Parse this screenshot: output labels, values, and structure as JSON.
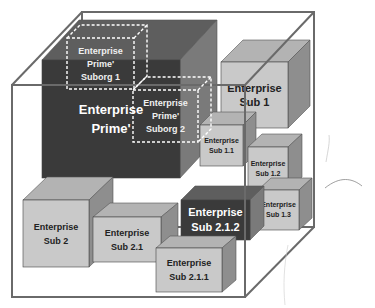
{
  "diagram": {
    "type": "nested-enterprise-cubes",
    "container": {
      "name": "enterprise-container-box"
    },
    "cubes": [
      {
        "id": "prime",
        "lines": [
          "Enterprise",
          "Prime'"
        ],
        "tone": "dark"
      },
      {
        "id": "sub1",
        "lines": [
          "Enterprise",
          "Sub 1"
        ],
        "tone": "light"
      },
      {
        "id": "sub1-1",
        "lines": [
          "Enterprise",
          "Sub 1.1"
        ],
        "tone": "light"
      },
      {
        "id": "sub1-2",
        "lines": [
          "Enterprise",
          "Sub 1.2"
        ],
        "tone": "light"
      },
      {
        "id": "sub1-3",
        "lines": [
          "Enterprise",
          "Sub 1.3"
        ],
        "tone": "light"
      },
      {
        "id": "sub2",
        "lines": [
          "Enterprise",
          "Sub 2"
        ],
        "tone": "light"
      },
      {
        "id": "sub2-1",
        "lines": [
          "Enterprise",
          "Sub 2.1"
        ],
        "tone": "light"
      },
      {
        "id": "sub2-1-2",
        "lines": [
          "Enterprise",
          "Sub 2.1.2"
        ],
        "tone": "dark"
      },
      {
        "id": "sub2-1-1",
        "lines": [
          "Enterprise",
          "Sub 2.1.1"
        ],
        "tone": "light"
      }
    ],
    "suborgs": [
      {
        "id": "suborg1",
        "lines": [
          "Enterprise",
          "Prime'",
          "Suborg 1"
        ]
      },
      {
        "id": "suborg2",
        "lines": [
          "Enterprise",
          "Prime'",
          "Suborg 2"
        ]
      }
    ],
    "colors": {
      "dark_front": "#3a3a3a",
      "dark_top": "#5e5e5e",
      "dark_side": "#7a7a7a",
      "light_front": "#c9c9c9",
      "light_top": "#b3b3b3",
      "light_side": "#8e8e8e",
      "frame": "#6a6a6a",
      "dark_text": "#ffffff",
      "light_text": "#222222",
      "dashed": "#ffffff"
    }
  }
}
